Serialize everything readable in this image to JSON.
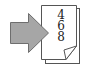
{
  "icon": {
    "name": "page-numbering-icon",
    "page_numbers": [
      "4",
      "6",
      "8"
    ],
    "colors": {
      "arrow_fill": "#a6a6a6",
      "arrow_stroke": "#6e6e6e",
      "page_fill": "#ffffff",
      "page_stroke": "#555555"
    }
  }
}
